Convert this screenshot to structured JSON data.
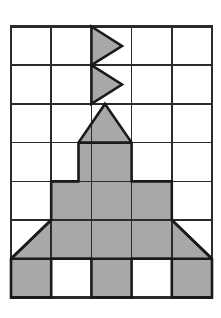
{
  "figure": {
    "background_color": "#ffffff",
    "grid": {
      "columns": 5,
      "rows": 7,
      "x_left": 11,
      "y_top": 26.5,
      "cell_width": 40.2,
      "cell_height": 38.7,
      "line_color": "#2b2b2b",
      "line_width": 1.6,
      "outer_line_width": 2.2,
      "x_lines": [
        11,
        51.2,
        91.4,
        131.6,
        171.8,
        212
      ],
      "y_lines": [
        26.5,
        65.2,
        103.9,
        142.6,
        181.3,
        220,
        258.7,
        297.4
      ]
    },
    "shape": {
      "fill_color": "#a8a8a8",
      "stroke_color": "#1a1a1a",
      "stroke_width": 2.6,
      "parts": [
        {
          "name": "antenna-triangle-upper",
          "type": "triangle",
          "points": "91.4,26.5 122,46 91.4,65.2"
        },
        {
          "name": "antenna-triangle-lower",
          "type": "triangle",
          "points": "91.4,65.2 122,84.5 91.4,103.9"
        },
        {
          "name": "nose-cone-triangle",
          "type": "triangle",
          "points": "105,103.9 131.6,142.6 78.5,142.6"
        },
        {
          "name": "body-upper-square",
          "type": "rect",
          "points": "78.5,142.6 131.6,142.6 131.6,181.3 78.5,181.3"
        },
        {
          "name": "body-wide-band-row5",
          "type": "rect",
          "points": "51.2,181.3 171.8,181.3 171.8,220 51.2,220"
        },
        {
          "name": "body-wide-band-row6",
          "type": "rect",
          "points": "51.2,220 171.8,220 171.8,258.7 51.2,258.7"
        },
        {
          "name": "left-wing-triangle",
          "type": "triangle",
          "points": "51.2,220 51.2,258.7 11,258.7"
        },
        {
          "name": "right-wing-triangle",
          "type": "triangle",
          "points": "171.8,220 212,258.7 171.8,258.7"
        },
        {
          "name": "leg-bottom-left",
          "type": "rect",
          "points": "11,258.7 51.2,258.7 51.2,297.4 11,297.4"
        },
        {
          "name": "leg-bottom-middle",
          "type": "rect",
          "points": "91.4,258.7 131.6,258.7 131.6,297.4 91.4,297.4"
        },
        {
          "name": "leg-bottom-right",
          "type": "rect",
          "points": "171.8,258.7 212,258.7 212,297.4 171.8,297.4"
        }
      ],
      "unshaded_cells": [
        "row7-col2",
        "row7-col4"
      ]
    }
  }
}
